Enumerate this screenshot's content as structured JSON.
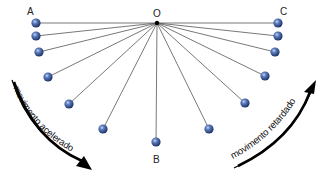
{
  "diagram": {
    "pivot": {
      "label": "O",
      "x": 157,
      "y": 23
    },
    "labels": {
      "A": "A",
      "B": "B",
      "C": "C"
    },
    "balls_left": [
      {
        "x": 36,
        "y": 23
      },
      {
        "x": 36,
        "y": 36
      },
      {
        "x": 39,
        "y": 52
      },
      {
        "x": 48,
        "y": 77
      },
      {
        "x": 69,
        "y": 104
      },
      {
        "x": 103,
        "y": 129
      }
    ],
    "ball_bottom": {
      "x": 156,
      "y": 142
    },
    "balls_right": [
      {
        "x": 278,
        "y": 23
      },
      {
        "x": 278,
        "y": 36
      },
      {
        "x": 275,
        "y": 52
      },
      {
        "x": 265,
        "y": 76
      },
      {
        "x": 245,
        "y": 103
      },
      {
        "x": 209,
        "y": 129
      }
    ],
    "arrows": {
      "left": {
        "text": "movimento acelerado",
        "direction": "down-right"
      },
      "right": {
        "text": "movimento retardado",
        "direction": "up-right"
      }
    },
    "colors": {
      "ball": "#3a5a9a",
      "ball_highlight": "#aabde0",
      "string": "#555555",
      "arrow": "#000000"
    }
  }
}
